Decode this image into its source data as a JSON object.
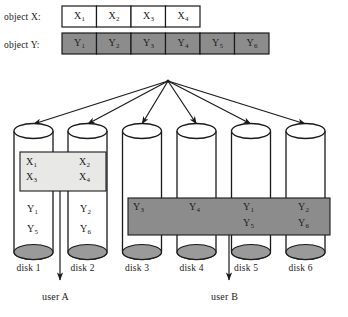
{
  "figure": {
    "type": "storage-striping-diagram",
    "colors": {
      "object_y_fill": "#8c8c8c",
      "object_x_fill": "#ffffff",
      "parity_box_fill": "#e8e8e6",
      "data_box_fill": "#8c8c8c",
      "disk_bottom_fill": "#9a9a9a",
      "stroke": "#1a1a1a"
    }
  },
  "rows": [
    {
      "name": "object-x",
      "label": "object X:",
      "cells": [
        {
          "base": "X",
          "sub": "1"
        },
        {
          "base": "X",
          "sub": "2"
        },
        {
          "base": "X",
          "sub": "3"
        },
        {
          "base": "X",
          "sub": "4"
        }
      ]
    },
    {
      "name": "object-y",
      "label": "object Y:",
      "cells": [
        {
          "base": "Y",
          "sub": "1"
        },
        {
          "base": "Y",
          "sub": "2"
        },
        {
          "base": "Y",
          "sub": "3"
        },
        {
          "base": "Y",
          "sub": "4"
        },
        {
          "base": "Y",
          "sub": "5"
        },
        {
          "base": "Y",
          "sub": "6"
        }
      ]
    }
  ],
  "disks": [
    {
      "name": "disk-1",
      "label": "disk 1"
    },
    {
      "name": "disk-2",
      "label": "disk 2"
    },
    {
      "name": "disk-3",
      "label": "disk 3"
    },
    {
      "name": "disk-4",
      "label": "disk 4"
    },
    {
      "name": "disk-5",
      "label": "disk 5"
    },
    {
      "name": "disk-6",
      "label": "disk 6"
    }
  ],
  "parity_box": {
    "name": "object-x-box",
    "spans_disks": [
      "disk 1",
      "disk 2"
    ],
    "entries": [
      {
        "base": "X",
        "sub": "1",
        "disk": "disk 1"
      },
      {
        "base": "X",
        "sub": "2",
        "disk": "disk 2"
      },
      {
        "base": "X",
        "sub": "3",
        "disk": "disk 1"
      },
      {
        "base": "X",
        "sub": "4",
        "disk": "disk 2"
      }
    ]
  },
  "loose_entries": [
    {
      "base": "Y",
      "sub": "1",
      "disk": "disk 1"
    },
    {
      "base": "Y",
      "sub": "2",
      "disk": "disk 2"
    },
    {
      "base": "Y",
      "sub": "5",
      "disk": "disk 1"
    },
    {
      "base": "Y",
      "sub": "6",
      "disk": "disk 2"
    }
  ],
  "data_box": {
    "name": "object-y-box",
    "spans_disks": [
      "disk 3",
      "disk 4",
      "disk 5",
      "disk 6"
    ],
    "entries": [
      {
        "base": "Y",
        "sub": "3",
        "disk": "disk 3"
      },
      {
        "base": "Y",
        "sub": "4",
        "disk": "disk 4"
      },
      {
        "base": "Y",
        "sub": "1",
        "disk": "disk 5"
      },
      {
        "base": "Y",
        "sub": "2",
        "disk": "disk 6"
      },
      {
        "base": "Y",
        "sub": "5",
        "disk": "disk 5"
      },
      {
        "base": "Y",
        "sub": "6",
        "disk": "disk 6"
      }
    ]
  },
  "users": [
    {
      "name": "user-a",
      "label": "user A",
      "disks": [
        "disk 1",
        "disk 2"
      ]
    },
    {
      "name": "user-b",
      "label": "user B",
      "disks": [
        "disk 3",
        "disk 4",
        "disk 5",
        "disk 6"
      ]
    }
  ],
  "fanout": {
    "name": "distribution-arrows",
    "origin": {
      "x": 168,
      "y": 81
    },
    "targets": 6
  }
}
